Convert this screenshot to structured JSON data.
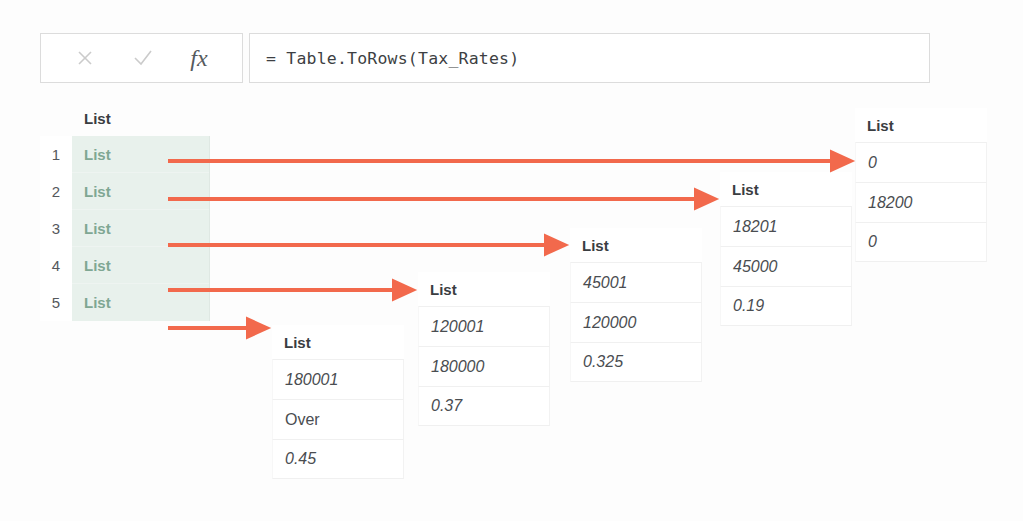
{
  "formula_bar": {
    "cancel_icon": "close-x-icon",
    "confirm_icon": "checkmark-icon",
    "fx_icon": "fx",
    "formula": "= Table.ToRows(Tax_Rates)"
  },
  "result_grid": {
    "column_header": "List",
    "rows": [
      {
        "index": "1",
        "value": "List"
      },
      {
        "index": "2",
        "value": "List"
      },
      {
        "index": "3",
        "value": "List"
      },
      {
        "index": "4",
        "value": "List"
      },
      {
        "index": "5",
        "value": "List"
      }
    ]
  },
  "list_cards": [
    {
      "header": "List",
      "values": [
        "0",
        "18200",
        "0"
      ],
      "value_kinds": [
        "number",
        "number",
        "number"
      ]
    },
    {
      "header": "List",
      "values": [
        "18201",
        "45000",
        "0.19"
      ],
      "value_kinds": [
        "number",
        "number",
        "number"
      ]
    },
    {
      "header": "List",
      "values": [
        "45001",
        "120000",
        "0.325"
      ],
      "value_kinds": [
        "number",
        "number",
        "number"
      ]
    },
    {
      "header": "List",
      "values": [
        "120001",
        "180000",
        "0.37"
      ],
      "value_kinds": [
        "number",
        "number",
        "number"
      ]
    },
    {
      "header": "List",
      "values": [
        "180001",
        "Over",
        "0.45"
      ],
      "value_kinds": [
        "number",
        "text",
        "number"
      ]
    }
  ],
  "arrows": {
    "color": "#f2694c",
    "count": 5
  }
}
